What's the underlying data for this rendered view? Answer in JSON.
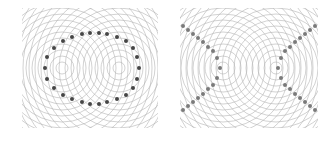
{
  "colors": {
    "background": "#ffffff",
    "wave_line": "#b4b4b4",
    "dot_left": "#454545",
    "dot_right": "#7a7a7a"
  },
  "wave": {
    "ring_spacing": 6,
    "ring_count": 22,
    "stroke_width": 0.6
  },
  "panels": [
    {
      "id": "left",
      "pattern": "ellipse",
      "offset": [
        22,
        8
      ],
      "size": [
        136,
        120
      ],
      "sources": [
        [
          40,
          60
        ],
        [
          97,
          60
        ]
      ],
      "dot_radius": 2.0,
      "dot_color_key": "dot_left",
      "dots": [
        [
          23,
          60
        ],
        [
          25,
          49
        ],
        [
          32,
          40
        ],
        [
          41,
          33
        ],
        [
          50,
          29
        ],
        [
          60,
          26
        ],
        [
          68,
          25
        ],
        [
          77,
          25
        ],
        [
          85,
          26
        ],
        [
          95,
          29
        ],
        [
          104,
          33
        ],
        [
          111,
          40
        ],
        [
          115,
          49
        ],
        [
          117,
          60
        ],
        [
          115,
          71
        ],
        [
          111,
          80
        ],
        [
          104,
          87
        ],
        [
          95,
          91
        ],
        [
          85,
          94
        ],
        [
          77,
          96
        ],
        [
          68,
          96
        ],
        [
          60,
          94
        ],
        [
          50,
          91
        ],
        [
          41,
          87
        ],
        [
          32,
          80
        ],
        [
          25,
          71
        ]
      ]
    },
    {
      "id": "right",
      "pattern": "hyperbola",
      "offset": [
        180,
        8
      ],
      "size": [
        138,
        120
      ],
      "sources": [
        [
          43,
          60
        ],
        [
          96,
          60
        ]
      ],
      "dot_radius": 2.0,
      "dot_color_key": "dot_right",
      "dots": [
        [
          3,
          18
        ],
        [
          8,
          22
        ],
        [
          13,
          26
        ],
        [
          18,
          30
        ],
        [
          23,
          34
        ],
        [
          28,
          39
        ],
        [
          33,
          43
        ],
        [
          37,
          50
        ],
        [
          40,
          60
        ],
        [
          37,
          70
        ],
        [
          33,
          77
        ],
        [
          28,
          81
        ],
        [
          23,
          86
        ],
        [
          18,
          90
        ],
        [
          13,
          94
        ],
        [
          8,
          98
        ],
        [
          3,
          102
        ],
        [
          135,
          18
        ],
        [
          130,
          22
        ],
        [
          125,
          26
        ],
        [
          120,
          30
        ],
        [
          115,
          34
        ],
        [
          110,
          39
        ],
        [
          105,
          43
        ],
        [
          101,
          50
        ],
        [
          98,
          60
        ],
        [
          101,
          70
        ],
        [
          105,
          77
        ],
        [
          110,
          81
        ],
        [
          115,
          86
        ],
        [
          120,
          90
        ],
        [
          125,
          94
        ],
        [
          130,
          98
        ],
        [
          135,
          102
        ]
      ]
    }
  ]
}
